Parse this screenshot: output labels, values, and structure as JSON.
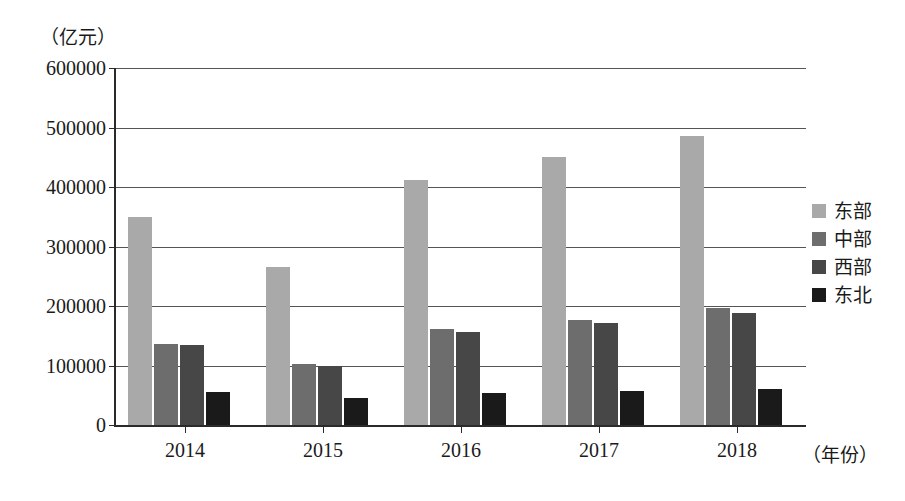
{
  "chart_data": {
    "type": "bar",
    "title": "",
    "subtitle": "",
    "xlabel": "（年份）",
    "ylabel": "（亿元）",
    "categories": [
      "2014",
      "2015",
      "2016",
      "2017",
      "2018"
    ],
    "ylim": [
      0,
      600000
    ],
    "ytick_labels": [
      "0",
      "100000",
      "200000",
      "300000",
      "400000",
      "500000",
      "600000"
    ],
    "ytick_values": [
      0,
      100000,
      200000,
      300000,
      400000,
      500000,
      600000
    ],
    "grid": true,
    "legend_position": "right",
    "series": [
      {
        "name": "东部",
        "color": "#a9a9a9",
        "values": [
          350000,
          265000,
          412000,
          450000,
          485000
        ]
      },
      {
        "name": "中部",
        "color": "#6d6d6d",
        "values": [
          137000,
          103000,
          162000,
          177000,
          196000
        ]
      },
      {
        "name": "西部",
        "color": "#474747",
        "values": [
          135000,
          100000,
          157000,
          171000,
          188000
        ]
      },
      {
        "name": "东北",
        "color": "#1a1a1a",
        "values": [
          56000,
          45000,
          54000,
          57000,
          60000
        ]
      }
    ]
  }
}
